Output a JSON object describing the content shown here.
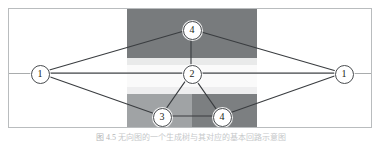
{
  "figure": {
    "caption_label": "图 4.5",
    "caption_text": "无向图的一个生成树与其对应的基本回路示意图",
    "frame": {
      "border_color": "#b9bcbe",
      "background": "#ffffff"
    }
  },
  "regions": [
    {
      "name": "top-band",
      "shade": "dark",
      "color": "#787b7d"
    },
    {
      "name": "mid-upper-edge",
      "shade": "near-white",
      "color": "#e9eaea"
    },
    {
      "name": "white-band",
      "shade": "white",
      "color": "#fafafa"
    },
    {
      "name": "mid-lower-edge",
      "shade": "near-white",
      "color": "#eeeeef"
    },
    {
      "name": "bottom-left",
      "shade": "light-grey",
      "color": "#a0a3a5"
    },
    {
      "name": "bottom-right",
      "shade": "dark",
      "color": "#7c7f81"
    }
  ],
  "graph": {
    "edge_color": "#3a3d40",
    "node_fill": "#ffffff",
    "node_stroke": "#4a4d50",
    "nodes": [
      {
        "id": "left",
        "label": "1",
        "x": 30,
        "y": 64
      },
      {
        "id": "right",
        "label": "1",
        "x": 334,
        "y": 64
      },
      {
        "id": "top",
        "label": "4",
        "x": 182,
        "y": 20
      },
      {
        "id": "center",
        "label": "2",
        "x": 182,
        "y": 64
      },
      {
        "id": "bl",
        "label": "3",
        "x": 152,
        "y": 107
      },
      {
        "id": "br",
        "label": "4",
        "x": 212,
        "y": 107
      }
    ],
    "edges": [
      {
        "from": "left",
        "to": "top"
      },
      {
        "from": "top",
        "to": "right"
      },
      {
        "from": "left",
        "to": "bl"
      },
      {
        "from": "br",
        "to": "right"
      },
      {
        "from": "left",
        "to": "center"
      },
      {
        "from": "center",
        "to": "right"
      },
      {
        "from": "center",
        "to": "top"
      },
      {
        "from": "center",
        "to": "bl"
      },
      {
        "from": "center",
        "to": "br"
      },
      {
        "from": "bl",
        "to": "br"
      }
    ]
  }
}
